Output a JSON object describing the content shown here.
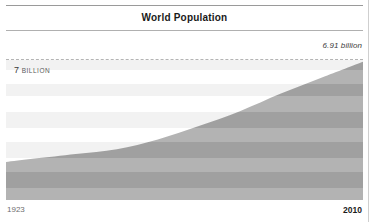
{
  "header": {
    "title": "World Population"
  },
  "annotations": {
    "reference_value_label": "6.91 billion",
    "axis_inner_number": "7",
    "axis_inner_unit": "BILLION"
  },
  "axis": {
    "x_start": "1923",
    "x_end": "2010"
  },
  "colors": {
    "band_light": "#f2f2f2",
    "band_white": "#ffffff",
    "area_fill": "#b3b3b3",
    "area_fill_dark": "#a0a0a0",
    "rule": "#9a9a9a",
    "dashed_line": "#b4b4b4",
    "text_dark": "#1a1a1a",
    "text_muted": "#6e6e6e",
    "page_border": "#cfcfcf"
  },
  "chart_data": {
    "type": "area",
    "title": "World Population",
    "xlabel": "",
    "ylabel": "",
    "grid": true,
    "legend_position": "none",
    "xlim": [
      1923,
      2010
    ],
    "ylim": [
      0,
      7.0
    ],
    "y_unit": "billion",
    "reference_line": {
      "value": 7.0,
      "style": "dashed",
      "label": "7 BILLION"
    },
    "annotation": {
      "text": "6.91 billion",
      "x": 2010,
      "y": 6.91
    },
    "x_tick_labels": [
      "1923",
      "2010"
    ],
    "series": [
      {
        "name": "World population",
        "x": [
          1923,
          1930,
          1940,
          1950,
          1960,
          1970,
          1980,
          1990,
          2000,
          2010
        ],
        "values": [
          1.9,
          2.07,
          2.3,
          2.54,
          3.03,
          3.7,
          4.44,
          5.32,
          6.12,
          6.91
        ]
      }
    ],
    "bands": [
      {
        "y_top": 7.0,
        "y_bottom": 6.5,
        "shade": "light"
      },
      {
        "y_top": 6.5,
        "y_bottom": 5.8,
        "shade": "white"
      },
      {
        "y_top": 5.8,
        "y_bottom": 5.2,
        "shade": "light"
      },
      {
        "y_top": 5.2,
        "y_bottom": 4.4,
        "shade": "white"
      },
      {
        "y_top": 4.4,
        "y_bottom": 3.6,
        "shade": "light"
      },
      {
        "y_top": 3.6,
        "y_bottom": 2.9,
        "shade": "white"
      },
      {
        "y_top": 2.9,
        "y_bottom": 2.1,
        "shade": "light"
      },
      {
        "y_top": 2.1,
        "y_bottom": 1.4,
        "shade": "white"
      },
      {
        "y_top": 1.4,
        "y_bottom": 0.6,
        "shade": "light"
      },
      {
        "y_top": 0.6,
        "y_bottom": 0.0,
        "shade": "white"
      }
    ]
  }
}
